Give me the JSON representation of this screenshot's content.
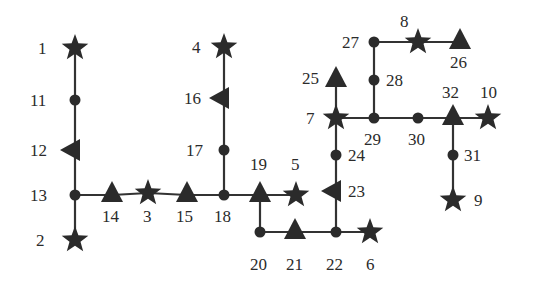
{
  "diagram": {
    "type": "network-topology",
    "colors": {
      "ink": "#2b2b2b",
      "edge": "#333333",
      "background": "#ffffff"
    },
    "legend_note": "star = generator bus, triangle = load bus, circle = junction bus",
    "nodes": [
      {
        "id": "1",
        "shape": "star",
        "x": 75,
        "y": 48,
        "label": "1",
        "lx": 38,
        "ly": 54
      },
      {
        "id": "11",
        "shape": "circle",
        "x": 75,
        "y": 100,
        "label": "11",
        "lx": 30,
        "ly": 106
      },
      {
        "id": "12",
        "shape": "triangle-left",
        "x": 72,
        "y": 150,
        "label": "12",
        "lx": 30,
        "ly": 156
      },
      {
        "id": "13",
        "shape": "circle",
        "x": 75,
        "y": 195,
        "label": "13",
        "lx": 30,
        "ly": 201
      },
      {
        "id": "2",
        "shape": "star",
        "x": 75,
        "y": 240,
        "label": "2",
        "lx": 36,
        "ly": 246
      },
      {
        "id": "14",
        "shape": "triangle-up",
        "x": 112,
        "y": 193,
        "label": "14",
        "lx": 102,
        "ly": 222
      },
      {
        "id": "3",
        "shape": "star",
        "x": 148,
        "y": 193,
        "label": "3",
        "lx": 143,
        "ly": 222
      },
      {
        "id": "15",
        "shape": "triangle-up",
        "x": 187,
        "y": 193,
        "label": "15",
        "lx": 176,
        "ly": 222
      },
      {
        "id": "18",
        "shape": "circle",
        "x": 224,
        "y": 195,
        "label": "18",
        "lx": 214,
        "ly": 222
      },
      {
        "id": "4",
        "shape": "star",
        "x": 224,
        "y": 47,
        "label": "4",
        "lx": 192,
        "ly": 53
      },
      {
        "id": "16",
        "shape": "triangle-left",
        "x": 221,
        "y": 98,
        "label": "16",
        "lx": 184,
        "ly": 104
      },
      {
        "id": "17",
        "shape": "circle",
        "x": 224,
        "y": 150,
        "label": "17",
        "lx": 186,
        "ly": 156
      },
      {
        "id": "19",
        "shape": "triangle-up",
        "x": 260,
        "y": 193,
        "label": "19",
        "lx": 250,
        "ly": 170
      },
      {
        "id": "5",
        "shape": "star",
        "x": 296,
        "y": 195,
        "label": "5",
        "lx": 291,
        "ly": 170
      },
      {
        "id": "20",
        "shape": "circle",
        "x": 260,
        "y": 232,
        "label": "20",
        "lx": 250,
        "ly": 270
      },
      {
        "id": "21",
        "shape": "triangle-up",
        "x": 295,
        "y": 230,
        "label": "21",
        "lx": 286,
        "ly": 270
      },
      {
        "id": "22",
        "shape": "circle",
        "x": 336,
        "y": 232,
        "label": "22",
        "lx": 326,
        "ly": 270
      },
      {
        "id": "6",
        "shape": "star",
        "x": 370,
        "y": 232,
        "label": "6",
        "lx": 366,
        "ly": 270
      },
      {
        "id": "23",
        "shape": "triangle-left",
        "x": 333,
        "y": 191,
        "label": "23",
        "lx": 348,
        "ly": 197
      },
      {
        "id": "24",
        "shape": "circle",
        "x": 336,
        "y": 155,
        "label": "24",
        "lx": 348,
        "ly": 161
      },
      {
        "id": "7",
        "shape": "star",
        "x": 336,
        "y": 118,
        "label": "7",
        "lx": 306,
        "ly": 124
      },
      {
        "id": "25",
        "shape": "triangle-up",
        "x": 336,
        "y": 78,
        "label": "25",
        "lx": 302,
        "ly": 84
      },
      {
        "id": "27",
        "shape": "circle",
        "x": 374,
        "y": 42,
        "label": "27",
        "lx": 342,
        "ly": 48
      },
      {
        "id": "8",
        "shape": "star",
        "x": 418,
        "y": 42,
        "label": "8",
        "lx": 400,
        "ly": 27
      },
      {
        "id": "26",
        "shape": "triangle-up",
        "x": 460,
        "y": 40,
        "label": "26",
        "lx": 450,
        "ly": 68
      },
      {
        "id": "28",
        "shape": "circle",
        "x": 374,
        "y": 80,
        "label": "28",
        "lx": 386,
        "ly": 86
      },
      {
        "id": "29",
        "shape": "circle",
        "x": 374,
        "y": 118,
        "label": "29",
        "lx": 364,
        "ly": 145
      },
      {
        "id": "30",
        "shape": "circle",
        "x": 418,
        "y": 118,
        "label": "30",
        "lx": 408,
        "ly": 145
      },
      {
        "id": "32",
        "shape": "triangle-up",
        "x": 453,
        "y": 116,
        "label": "32",
        "lx": 442,
        "ly": 98
      },
      {
        "id": "10",
        "shape": "star",
        "x": 488,
        "y": 118,
        "label": "10",
        "lx": 480,
        "ly": 98
      },
      {
        "id": "31",
        "shape": "circle",
        "x": 453,
        "y": 155,
        "label": "31",
        "lx": 464,
        "ly": 161
      },
      {
        "id": "9",
        "shape": "star",
        "x": 453,
        "y": 200,
        "label": "9",
        "lx": 474,
        "ly": 206
      }
    ],
    "edges": [
      [
        "1",
        "11"
      ],
      [
        "11",
        "12"
      ],
      [
        "12",
        "13"
      ],
      [
        "13",
        "2"
      ],
      [
        "13",
        "14"
      ],
      [
        "14",
        "3"
      ],
      [
        "3",
        "15"
      ],
      [
        "15",
        "18"
      ],
      [
        "4",
        "16"
      ],
      [
        "16",
        "17"
      ],
      [
        "17",
        "18"
      ],
      [
        "18",
        "19"
      ],
      [
        "19",
        "5"
      ],
      [
        "19",
        "20"
      ],
      [
        "20",
        "21"
      ],
      [
        "21",
        "22"
      ],
      [
        "22",
        "6"
      ],
      [
        "22",
        "23"
      ],
      [
        "23",
        "24"
      ],
      [
        "24",
        "7"
      ],
      [
        "7",
        "25"
      ],
      [
        "7",
        "29"
      ],
      [
        "29",
        "28"
      ],
      [
        "28",
        "27"
      ],
      [
        "27",
        "8"
      ],
      [
        "8",
        "26"
      ],
      [
        "29",
        "30"
      ],
      [
        "30",
        "32"
      ],
      [
        "32",
        "10"
      ],
      [
        "32",
        "31"
      ],
      [
        "31",
        "9"
      ]
    ]
  }
}
